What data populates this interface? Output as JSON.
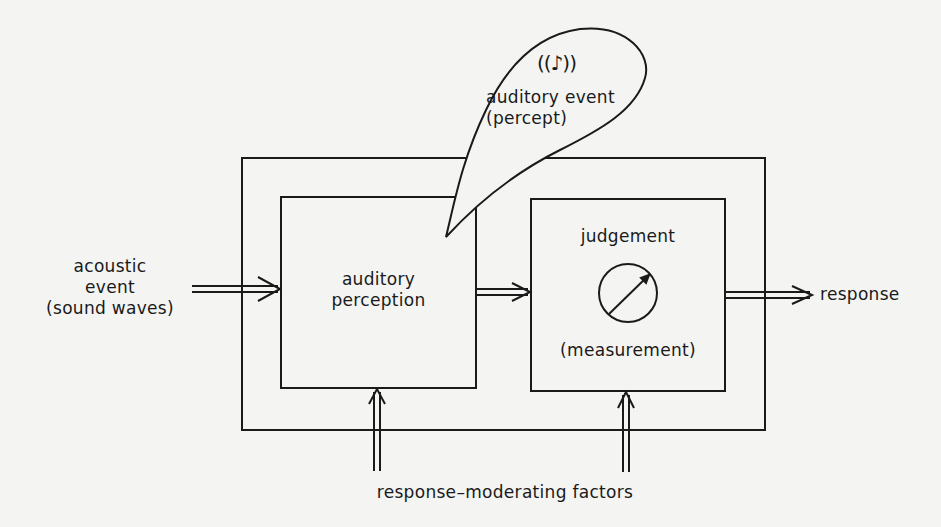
{
  "diagram": {
    "type": "block-flow",
    "colors": {
      "background": "#f4f4f3",
      "stroke": "#1a1a1a"
    },
    "input": {
      "line1": "acoustic",
      "line2": "event",
      "line3": "(sound waves)"
    },
    "percept_bubble": {
      "icon": "((♪))",
      "line1": "auditory event",
      "line2": "(percept)"
    },
    "blocks": {
      "perception": {
        "line1": "auditory",
        "line2": "perception"
      },
      "judgement": {
        "title": "judgement",
        "subtitle": "(measurement)",
        "icon": "dial-gauge"
      }
    },
    "output": {
      "label": "response"
    },
    "moderators": {
      "label": "response–moderating factors"
    },
    "connections": [
      {
        "from": "acoustic event",
        "to": "auditory perception"
      },
      {
        "from": "auditory perception",
        "to": "judgement"
      },
      {
        "from": "judgement",
        "to": "response"
      },
      {
        "from": "response-moderating factors",
        "to": "auditory perception"
      },
      {
        "from": "response-moderating factors",
        "to": "judgement"
      }
    ]
  }
}
